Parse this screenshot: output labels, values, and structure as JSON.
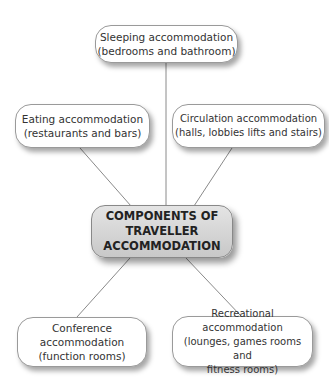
{
  "diagram": {
    "center": {
      "lines": [
        "COMPONENTS OF",
        "TRAVELLER",
        "ACCOMMODATION"
      ]
    },
    "nodes": [
      {
        "id": "sleeping",
        "lines": [
          "Sleeping accommodation",
          "(bedrooms and bathroom)"
        ]
      },
      {
        "id": "eating",
        "lines": [
          "Eating accommodation",
          "(restaurants and bars)"
        ]
      },
      {
        "id": "circulation",
        "lines": [
          "Circulation accommodation",
          "(halls, lobbies lifts and stairs)"
        ]
      },
      {
        "id": "conference",
        "lines": [
          "Conference",
          "accommodation",
          "(function rooms)"
        ]
      },
      {
        "id": "recreational",
        "lines": [
          "Recreational accommodation",
          "(lounges, games rooms and",
          "fitness rooms)"
        ]
      }
    ],
    "colors": {
      "line": "#8a8a8a",
      "node_border": "#9a9a9a",
      "center_fill": "#d4d4d4"
    }
  }
}
